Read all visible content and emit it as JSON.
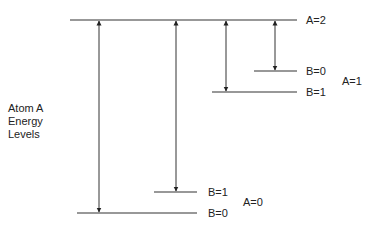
{
  "diagram": {
    "side_label": [
      "Atom A",
      "Energy",
      "Levels"
    ],
    "levels": [
      {
        "id": "A2",
        "label": "A=2",
        "x1": 70,
        "x2": 297,
        "y": 20
      },
      {
        "id": "A1-B0",
        "label": "B=0",
        "x1": 254,
        "x2": 297,
        "y": 71
      },
      {
        "id": "A1-B1",
        "label": "B=1",
        "x1": 212,
        "x2": 297,
        "y": 92
      },
      {
        "id": "A0-B1",
        "label": "B=1",
        "x1": 154,
        "x2": 197,
        "y": 192
      },
      {
        "id": "A0-B0",
        "label": "B=0",
        "x1": 77,
        "x2": 197,
        "y": 213
      }
    ],
    "group_labels": [
      {
        "label": "A=1"
      },
      {
        "label": "A=0"
      }
    ],
    "arrows": [
      {
        "from": "A2",
        "to": "A0-B0",
        "x": 99,
        "heads": "both"
      },
      {
        "from": "A2",
        "to": "A0-B1",
        "x": 176,
        "heads": "both"
      },
      {
        "from": "A2",
        "to": "A1-B1",
        "x": 226,
        "heads": "both"
      },
      {
        "from": "A2",
        "to": "A1-B0",
        "x": 275,
        "heads": "both"
      }
    ],
    "line_color": "#333333"
  }
}
